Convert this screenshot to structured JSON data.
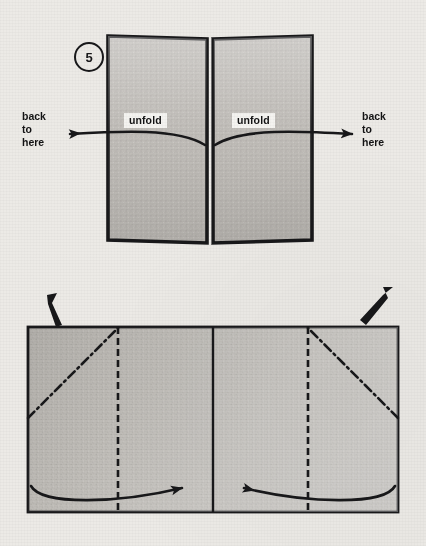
{
  "page": {
    "kind": "origami-instruction-sheet",
    "background_color": "#eceae6",
    "ink_color": "#18181a",
    "paper_fill": "#b9b6b1"
  },
  "figures": [
    {
      "id": "step5",
      "step_label": "5",
      "description": "Two vertical panels standing open with a narrow gap at the center; curved arrows sweep outward from the center crease to each side.",
      "labels": {
        "unfold_left": "unfold",
        "unfold_right": "unfold"
      },
      "notes": {
        "back_left": [
          "back",
          "to",
          "here"
        ],
        "back_right": [
          "back",
          "to",
          "here"
        ]
      },
      "arrows": [
        {
          "name": "unfold-arrow-left",
          "direction": "left",
          "style": "curved-solid"
        },
        {
          "name": "unfold-arrow-right",
          "direction": "right",
          "style": "curved-solid"
        }
      ]
    },
    {
      "id": "step6",
      "step_label": "6",
      "description": "A wide rectangle divided by a solid center line, with dashed vertical fold lines inset from each end and dash-dot diagonal crease lines in the outer corners.",
      "notes": {
        "fold_left": [
          "fold",
          "top",
          "layer",
          "to",
          "middle"
        ],
        "fold_right": [
          "fold",
          "top",
          "layer",
          "to",
          "middle"
        ]
      },
      "arrows": [
        {
          "name": "fold-arrow-left",
          "direction": "right",
          "style": "curved-solid"
        },
        {
          "name": "fold-arrow-right",
          "direction": "left",
          "style": "curved-solid"
        },
        {
          "name": "pointer-arrow-left",
          "direction": "down-right",
          "style": "solid-tapered"
        },
        {
          "name": "pointer-arrow-right",
          "direction": "down-left",
          "style": "solid-tapered"
        }
      ],
      "line_styles": {
        "center": "solid",
        "inset_verticals": "dashed",
        "diagonals": "dash-dot"
      }
    }
  ]
}
